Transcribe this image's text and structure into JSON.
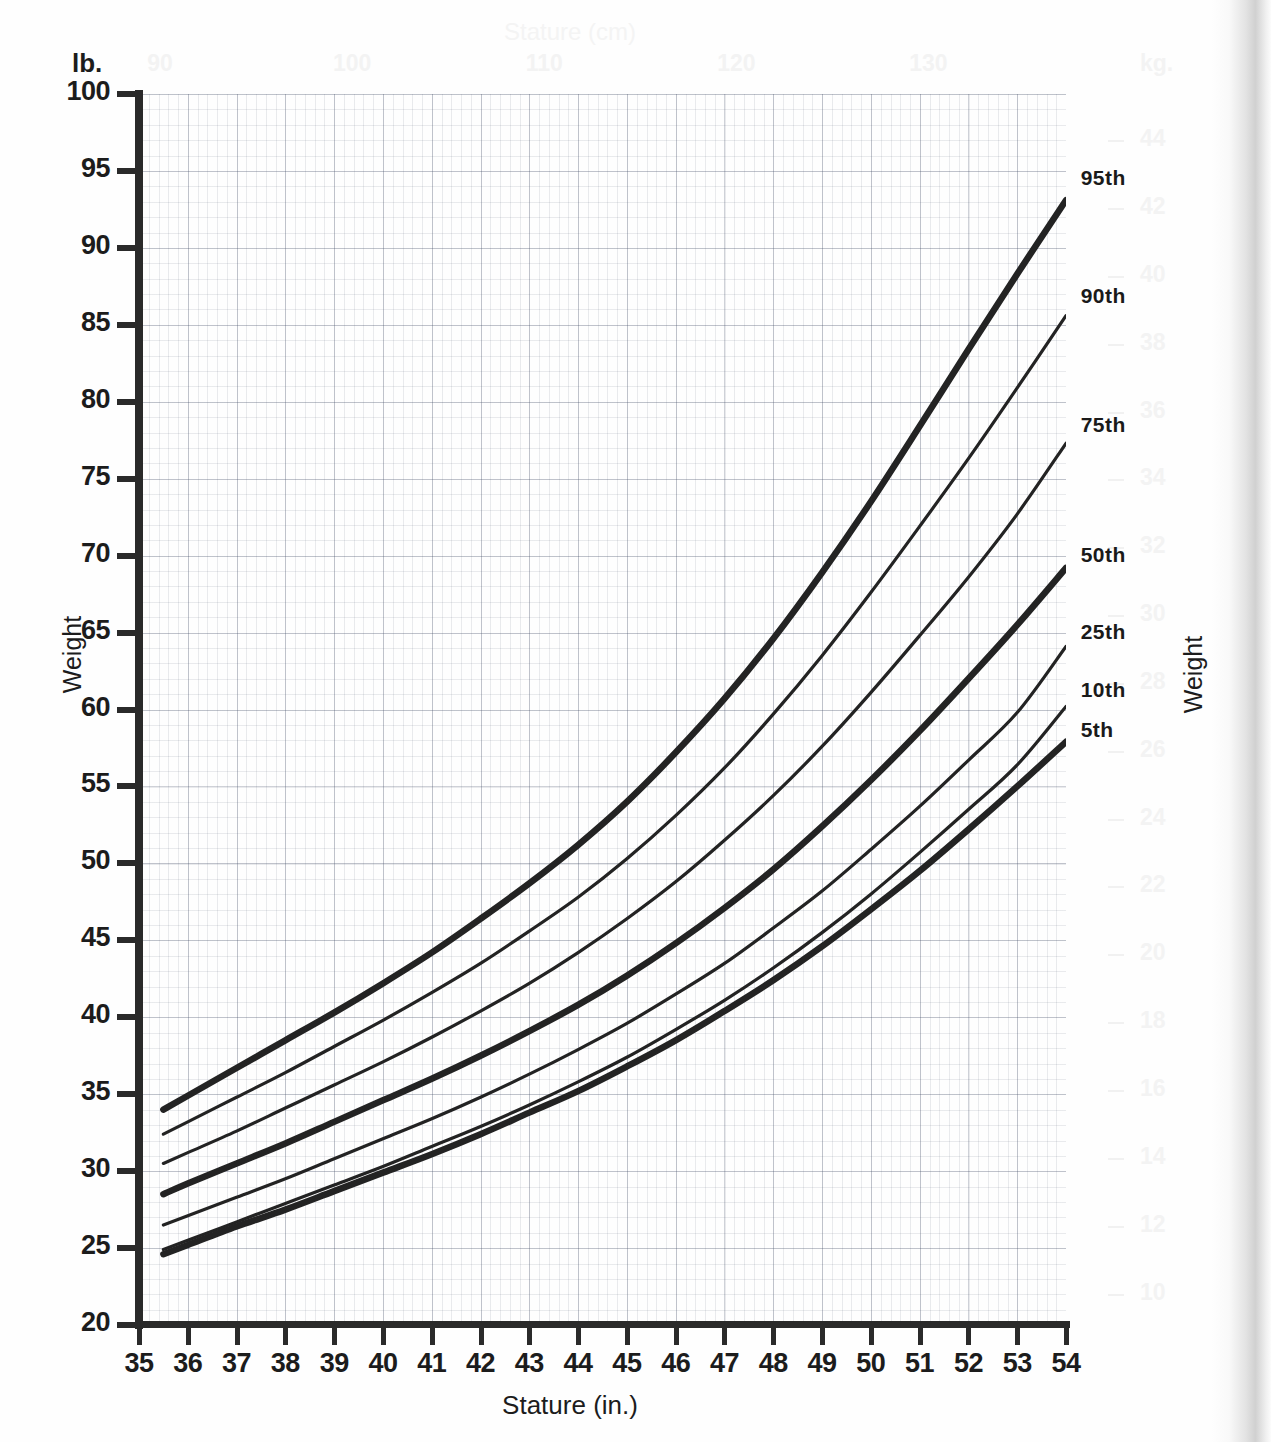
{
  "chart_data": {
    "type": "line",
    "title": "",
    "xlabel": "Stature (in.)",
    "ylabel": "Weight",
    "xlabel_secondary": "Stature (cm)",
    "ylabel_secondary": "Weight",
    "unit_left": "lb.",
    "unit_right": "kg.",
    "xlim": [
      35,
      54
    ],
    "ylim": [
      20,
      100
    ],
    "xlim_secondary": [
      88.9,
      137.2
    ],
    "ylim_secondary": [
      9.07,
      45.36
    ],
    "grid": true,
    "legend_position": "right-inline",
    "x_ticks": [
      35,
      36,
      37,
      38,
      39,
      40,
      41,
      42,
      43,
      44,
      45,
      46,
      47,
      48,
      49,
      50,
      51,
      52,
      53,
      54
    ],
    "y_ticks": [
      20,
      25,
      30,
      35,
      40,
      45,
      50,
      55,
      60,
      65,
      70,
      75,
      80,
      85,
      90,
      95,
      100
    ],
    "x_ticks_secondary": [
      90,
      100,
      110,
      120,
      130
    ],
    "y_ticks_secondary": [
      10,
      12,
      14,
      16,
      18,
      20,
      22,
      24,
      26,
      28,
      30,
      32,
      34,
      36,
      38,
      40,
      42,
      44
    ],
    "x": [
      35.5,
      36,
      37,
      38,
      39,
      40,
      41,
      42,
      43,
      44,
      45,
      46,
      47,
      48,
      49,
      50,
      51,
      52,
      53,
      54
    ],
    "series": [
      {
        "name": "95th",
        "label": "95th",
        "bold": true,
        "values": [
          34.0,
          34.9,
          36.7,
          38.5,
          40.3,
          42.2,
          44.2,
          46.4,
          48.7,
          51.2,
          54.0,
          57.2,
          60.7,
          64.6,
          68.9,
          73.5,
          78.4,
          83.4,
          88.3,
          93.1
        ]
      },
      {
        "name": "90th",
        "label": "90th",
        "bold": false,
        "values": [
          32.4,
          33.2,
          34.8,
          36.4,
          38.1,
          39.8,
          41.6,
          43.5,
          45.6,
          47.8,
          50.3,
          53.1,
          56.2,
          59.7,
          63.5,
          67.6,
          71.9,
          76.3,
          80.9,
          85.6
        ]
      },
      {
        "name": "75th",
        "label": "75th",
        "bold": false,
        "values": [
          30.5,
          31.2,
          32.6,
          34.1,
          35.6,
          37.1,
          38.7,
          40.4,
          42.2,
          44.2,
          46.4,
          48.8,
          51.5,
          54.4,
          57.6,
          61.1,
          64.8,
          68.6,
          72.7,
          77.3
        ]
      },
      {
        "name": "50th",
        "label": "50th",
        "bold": true,
        "values": [
          28.5,
          29.2,
          30.5,
          31.8,
          33.2,
          34.6,
          36.0,
          37.5,
          39.1,
          40.8,
          42.7,
          44.8,
          47.1,
          49.6,
          52.4,
          55.4,
          58.6,
          62.0,
          65.5,
          69.2
        ]
      },
      {
        "name": "25th",
        "label": "25th",
        "bold": false,
        "values": [
          26.5,
          27.1,
          28.3,
          29.5,
          30.8,
          32.1,
          33.4,
          34.8,
          36.3,
          37.9,
          39.6,
          41.5,
          43.5,
          45.8,
          48.2,
          50.9,
          53.7,
          56.7,
          59.8,
          64.1
        ]
      },
      {
        "name": "10th",
        "label": "10th",
        "bold": false,
        "values": [
          24.9,
          25.5,
          26.7,
          27.9,
          29.1,
          30.3,
          31.6,
          32.9,
          34.3,
          35.8,
          37.4,
          39.2,
          41.1,
          43.2,
          45.5,
          48.0,
          50.7,
          53.5,
          56.4,
          60.2
        ]
      },
      {
        "name": "5th",
        "label": "5th",
        "bold": true,
        "values": [
          24.6,
          25.2,
          26.4,
          27.5,
          28.7,
          29.9,
          31.1,
          32.4,
          33.8,
          35.2,
          36.8,
          38.5,
          40.4,
          42.4,
          44.6,
          47.0,
          49.5,
          52.2,
          55.0,
          57.9
        ]
      }
    ],
    "annotations": [
      {
        "text": "95th",
        "x": 54.3,
        "y": 94.5
      },
      {
        "text": "90th",
        "x": 54.3,
        "y": 86.8
      },
      {
        "text": "75th",
        "x": 54.3,
        "y": 78.4
      },
      {
        "text": "50th",
        "x": 54.3,
        "y": 70.0
      },
      {
        "text": "25th",
        "x": 54.3,
        "y": 65.0
      },
      {
        "text": "10th",
        "x": 54.3,
        "y": 61.2
      },
      {
        "text": "5th",
        "x": 54.3,
        "y": 58.6
      }
    ]
  },
  "axes": {
    "left_unit": "lb.",
    "right_unit": "kg.",
    "left_title": "Weight",
    "right_title": "Weight",
    "bottom_title": "Stature (in.)",
    "top_title": "Stature (cm)"
  }
}
